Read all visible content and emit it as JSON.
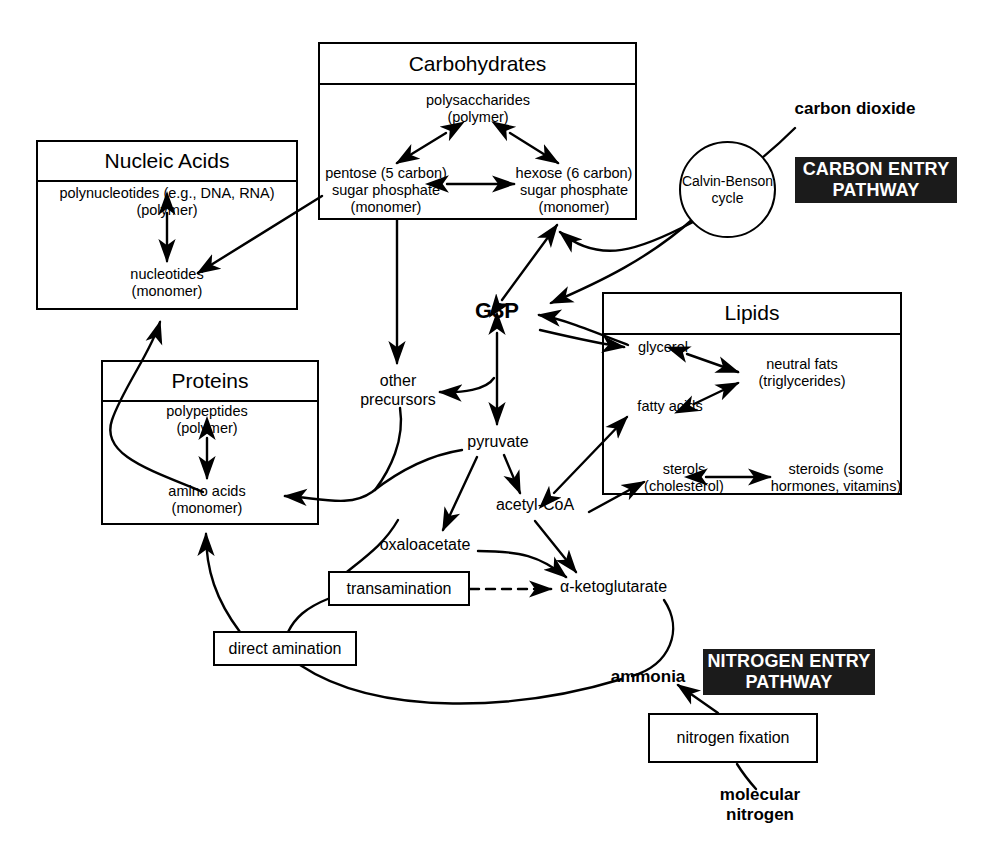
{
  "diagram": {
    "groups": {
      "carbohydrates": {
        "title": "Carbohydrates",
        "nodes": {
          "polysaccharides": "polysaccharides\n(polymer)",
          "pentose": "pentose (5 carbon)\nsugar phosphate\n(monomer)",
          "hexose": "hexose (6 carbon)\nsugar phosphate\n(monomer)"
        }
      },
      "nucleic_acids": {
        "title": "Nucleic Acids",
        "nodes": {
          "polynucleotides": "polynucleotides (e.g., DNA, RNA)\n(polymer)",
          "nucleotides": "nucleotides\n(monomer)"
        }
      },
      "proteins": {
        "title": "Proteins",
        "nodes": {
          "polypeptides": "polypeptides\n(polymer)",
          "amino_acids": "amino acids\n(monomer)"
        }
      },
      "lipids": {
        "title": "Lipids",
        "nodes": {
          "glycerol": "glycerol",
          "neutral_fats": "neutral fats\n(triglycerides)",
          "fatty_acids": "fatty acids",
          "sterols": "sterols\n(cholesterol)",
          "steroids": "steroids (some\nhormones, vitamins)"
        }
      }
    },
    "central_nodes": {
      "g3p": "G3P",
      "other_precursors": "other\nprecursors",
      "pyruvate": "pyruvate",
      "acetyl_coa": "acetyl-CoA",
      "oxaloacetate": "oxaloacetate",
      "alpha_ketoglutarate": "α-ketoglutarate"
    },
    "process_boxes": {
      "transamination": "transamination",
      "direct_amination": "direct amination",
      "nitrogen_fixation": "nitrogen fixation"
    },
    "cycle": {
      "calvin_benson": "Calvin-Benson\ncycle"
    },
    "inputs": {
      "carbon_dioxide": "carbon dioxide",
      "ammonia": "ammonia",
      "molecular_nitrogen": "molecular\nnitrogen"
    },
    "tags": {
      "carbon_entry": "CARBON ENTRY\nPATHWAY",
      "nitrogen_entry": "NITROGEN ENTRY\nPATHWAY"
    },
    "colors": {
      "stroke": "#000000",
      "background": "#ffffff",
      "tag_background": "#1b1b1b",
      "tag_text": "#ffffff"
    }
  }
}
